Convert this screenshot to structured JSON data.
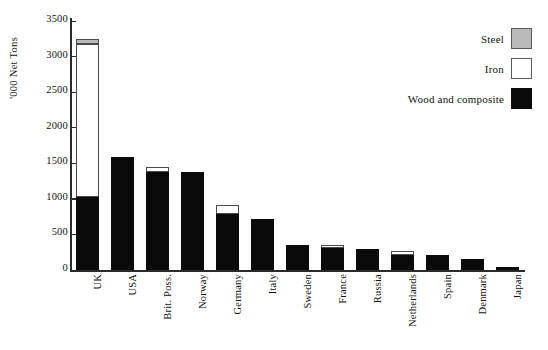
{
  "chart_data": {
    "type": "bar",
    "stacked": true,
    "title": "",
    "xlabel": "",
    "ylabel": "'000 Net Tons",
    "ylim": [
      0,
      3500
    ],
    "ytick_step": 500,
    "yticks": [
      "0",
      "500",
      "1000",
      "1500",
      "2000",
      "2500",
      "3000",
      "3500"
    ],
    "grid": false,
    "legend_position": "top-right",
    "categories": [
      "UK",
      "USA",
      "Brit. Poss.",
      "Norway",
      "Germany",
      "Italy",
      "Sweden",
      "France",
      "Russia",
      "Netherlands",
      "Spain",
      "Denmark",
      "Japan"
    ],
    "series": [
      {
        "name": "Wood and composite",
        "color": "#0a0a0a",
        "values": [
          1030,
          1590,
          1375,
          1375,
          790,
          710,
          345,
          310,
          290,
          210,
          215,
          155,
          45
        ]
      },
      {
        "name": "Iron",
        "color": "#ffffff",
        "values": [
          2150,
          0,
          70,
          0,
          120,
          0,
          0,
          40,
          0,
          55,
          0,
          0,
          0
        ]
      },
      {
        "name": "Steel",
        "color": "#b9b9b9",
        "values": [
          70,
          0,
          0,
          0,
          0,
          0,
          0,
          0,
          0,
          0,
          0,
          0,
          0
        ]
      }
    ],
    "totals": [
      3250,
      1590,
      1445,
      1375,
      910,
      710,
      345,
      350,
      290,
      265,
      215,
      155,
      45
    ]
  },
  "legend": {
    "items": [
      {
        "label": "Steel",
        "swatch": "steel-swatch"
      },
      {
        "label": "Iron",
        "swatch": "iron-swatch"
      },
      {
        "label": "Wood and composite",
        "swatch": "wood-swatch"
      }
    ]
  },
  "colors": {
    "steel": "#b9b9b9",
    "iron": "#ffffff",
    "wood": "#0a0a0a",
    "axis": "#2a2a2a",
    "background": "#ffffff"
  }
}
